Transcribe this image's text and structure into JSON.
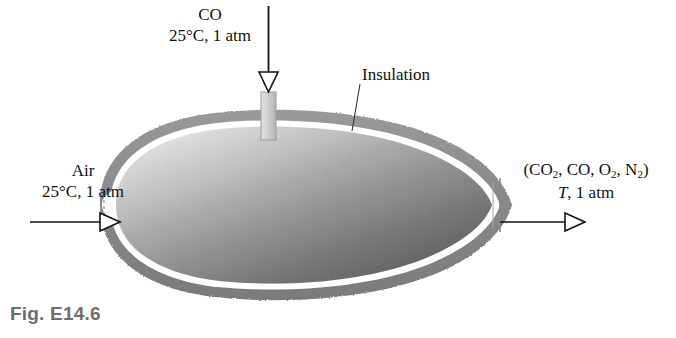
{
  "figure": {
    "caption": "Fig. E14.6",
    "caption_color": "#6e6e6e"
  },
  "labels": {
    "co_inlet": {
      "species": "CO",
      "state": "25°C, 1 atm"
    },
    "air_inlet": {
      "species": "Air",
      "state": "25°C, 1 atm"
    },
    "exit_stream": {
      "species_open": "(CO",
      "species_sub1": "2",
      "species_mid1": ", CO, O",
      "species_sub2": "2",
      "species_mid2": ", N",
      "species_sub3": "2",
      "species_close": ")",
      "temperature_symbol": "T",
      "state_rest": ", 1 atm"
    },
    "insulation": "Insulation"
  },
  "colors": {
    "insulation_shell": "#8a8a8a",
    "insulation_shell_dark": "#7c7c7c",
    "gap_line": "#ffffff",
    "interior_light": "#ececec",
    "interior_mid": "#bdbdbd",
    "interior_dark": "#9a9a9a",
    "pipe_fill": "#cfcfcf",
    "pipe_stroke": "#9a9a9a",
    "arrow_stroke": "#111111",
    "leader_line": "#3a3a3a",
    "background": "#ffffff"
  },
  "geometry": {
    "vessel_left_x": 100,
    "vessel_right_x": 510,
    "vessel_center_y": 205,
    "co_pipe_x": 268,
    "co_arrow_top_y": 6,
    "co_arrow_tip_y": 92,
    "air_arrow_y": 222,
    "air_arrow_start_x": 30,
    "air_arrow_tip_x": 120,
    "exit_arrow_y": 222,
    "exit_arrow_start_x": 500,
    "exit_arrow_tip_x": 585,
    "insulation_leader_from": [
      360,
      84
    ],
    "insulation_leader_to": [
      352,
      131
    ]
  }
}
